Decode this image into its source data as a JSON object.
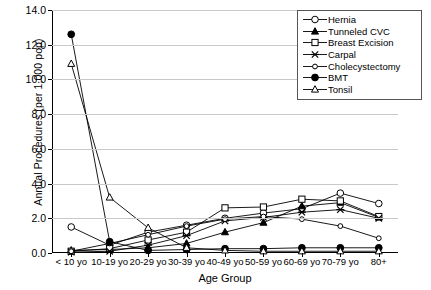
{
  "chart_data": {
    "type": "line",
    "title": "",
    "xlabel": "Age Group",
    "ylabel": "Annual Procedures (per 1,000 pop)",
    "categories": [
      "< 10 yo",
      "10-19 yo",
      "20-29 yo",
      "30-39 yo",
      "40-49 yo",
      "50-59 yo",
      "60-69 yo",
      "70-79 yo",
      "80+"
    ],
    "ylim": [
      0.0,
      14.0
    ],
    "ytick_step": 2.0,
    "ytick_labels": [
      "0.0",
      "2.0",
      "4.0",
      "6.0",
      "8.0",
      "10.0",
      "12.0",
      "14.0"
    ],
    "grid": "horizontal",
    "legend_position": "upper-right",
    "series": [
      {
        "name": "Hernia",
        "marker": "open-circle",
        "values": [
          1.5,
          0.45,
          1.2,
          1.6,
          2.0,
          2.3,
          2.55,
          3.45,
          2.85
        ]
      },
      {
        "name": "Tunneled CVC",
        "marker": "filled-triangle",
        "values": [
          0.15,
          0.2,
          0.3,
          0.55,
          1.2,
          1.75,
          2.7,
          2.9,
          2.05
        ]
      },
      {
        "name": "Breast Excision",
        "marker": "open-square",
        "values": [
          0.1,
          0.25,
          0.75,
          1.2,
          2.6,
          2.65,
          3.1,
          3.0,
          2.1
        ]
      },
      {
        "name": "Carpal",
        "marker": "cross",
        "values": [
          0.05,
          0.1,
          0.45,
          1.0,
          1.85,
          2.05,
          2.35,
          2.5,
          2.0
        ]
      },
      {
        "name": "Cholecystectomy",
        "marker": "small-open-circle",
        "values": [
          0.1,
          0.55,
          1.05,
          1.55,
          1.95,
          2.1,
          1.95,
          1.55,
          0.85
        ]
      },
      {
        "name": "BMT",
        "marker": "filled-circle",
        "values": [
          12.6,
          0.65,
          0.15,
          0.2,
          0.25,
          0.25,
          0.3,
          0.3,
          0.3
        ]
      },
      {
        "name": "Tonsil",
        "marker": "open-triangle",
        "values": [
          10.9,
          3.2,
          1.45,
          0.3,
          0.15,
          0.1,
          0.1,
          0.1,
          0.1
        ]
      }
    ]
  }
}
